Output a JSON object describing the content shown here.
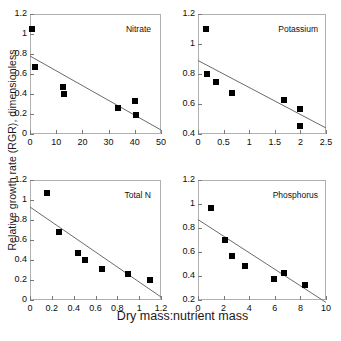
{
  "figure": {
    "xlabel": "Dry mass:nutrient mass",
    "ylabel": "Relative growth rate (RGR), dimensionless",
    "marker_color": "#000000",
    "line_color": "#6b6b6b",
    "border_color": "#b0b0b0",
    "background": "#ffffff"
  },
  "chart_data": [
    {
      "type": "scatter",
      "title": "Nitrate",
      "xlabel": "Dry mass:nutrient mass",
      "ylabel": "Relative growth rate (RGR), dimensionless",
      "xlim": [
        0,
        50
      ],
      "ylim": [
        0,
        1.2
      ],
      "xticks": [
        0,
        10,
        20,
        30,
        40,
        50
      ],
      "yticks": [
        0,
        0.2,
        0.4,
        0.6,
        0.8,
        1,
        1.2
      ],
      "xticklabels": [
        "0",
        "10",
        "20",
        "30",
        "40",
        "50"
      ],
      "yticklabels": [
        "0",
        "0.2",
        "0.4",
        "0.6",
        "0.8",
        "1",
        "1.2"
      ],
      "grid": false,
      "legend": "none",
      "x": [
        0.8,
        2.0,
        12.5,
        13.0,
        33.5,
        40.0,
        40.5
      ],
      "y": [
        1.05,
        0.67,
        0.47,
        0.4,
        0.26,
        0.33,
        0.19
      ],
      "fit_line": {
        "x0": 0,
        "y0": 0.78,
        "x1": 50,
        "y1": 0.04
      }
    },
    {
      "type": "scatter",
      "title": "Potassium",
      "xlabel": "Dry mass:nutrient mass",
      "ylabel": "Relative growth rate (RGR), dimensionless",
      "xlim": [
        0,
        2.5
      ],
      "ylim": [
        0.4,
        1.2
      ],
      "xticks": [
        0,
        0.5,
        1,
        1.5,
        2,
        2.5
      ],
      "yticks": [
        0.4,
        0.6,
        0.8,
        1,
        1.2
      ],
      "xticklabels": [
        "0",
        "0.5",
        "1",
        "1.5",
        "2",
        "2.5"
      ],
      "yticklabels": [
        "0.4",
        "0.6",
        "0.8",
        "1",
        "1.2"
      ],
      "grid": false,
      "legend": "none",
      "x": [
        0.15,
        0.17,
        0.35,
        0.66,
        1.68,
        2.0,
        2.0
      ],
      "y": [
        1.1,
        0.8,
        0.75,
        0.675,
        0.63,
        0.565,
        0.455
      ],
      "fit_line": {
        "x0": 0,
        "y0": 0.89,
        "x1": 2.5,
        "y1": 0.44
      }
    },
    {
      "type": "scatter",
      "title": "Total N",
      "xlabel": "Dry mass:nutrient mass",
      "ylabel": "Relative growth rate (RGR), dimensionless",
      "xlim": [
        0,
        1.2
      ],
      "ylim": [
        0,
        1.2
      ],
      "xticks": [
        0,
        0.2,
        0.4,
        0.6,
        0.8,
        1,
        1.2
      ],
      "yticks": [
        0,
        0.2,
        0.4,
        0.6,
        0.8,
        1,
        1.2
      ],
      "xticklabels": [
        "0",
        "0.2",
        "0.4",
        "0.6",
        "0.8",
        "1",
        "1.2"
      ],
      "yticklabels": [
        "0",
        "0.2",
        "0.4",
        "0.6",
        "0.8",
        "1",
        "1.2"
      ],
      "grid": false,
      "legend": "none",
      "x": [
        0.16,
        0.27,
        0.44,
        0.5,
        0.66,
        0.9,
        1.1
      ],
      "y": [
        1.07,
        0.68,
        0.475,
        0.405,
        0.31,
        0.26,
        0.205
      ],
      "fit_line": {
        "x0": 0,
        "y0": 0.93,
        "x1": 1.2,
        "y1": 0.03
      }
    },
    {
      "type": "scatter",
      "title": "Phosphorus",
      "xlabel": "Dry mass:nutrient mass",
      "ylabel": "Relative growth rate (RGR), dimensionless",
      "xlim": [
        0,
        10
      ],
      "ylim": [
        0.2,
        1.2
      ],
      "xticks": [
        0,
        2,
        4,
        6,
        8,
        10
      ],
      "yticks": [
        0.2,
        0.4,
        0.6,
        0.8,
        1,
        1.2
      ],
      "xticklabels": [
        "0",
        "2",
        "4",
        "6",
        "8",
        "10"
      ],
      "yticklabels": [
        "0.2",
        "0.4",
        "0.6",
        "0.8",
        "1",
        "1.2"
      ],
      "grid": false,
      "legend": "none",
      "x": [
        1.0,
        2.1,
        2.65,
        3.7,
        5.9,
        6.7,
        8.35
      ],
      "y": [
        0.97,
        0.7,
        0.57,
        0.485,
        0.375,
        0.425,
        0.325
      ],
      "fit_line": {
        "x0": 0,
        "y0": 0.87,
        "x1": 10,
        "y1": 0.18
      }
    }
  ]
}
